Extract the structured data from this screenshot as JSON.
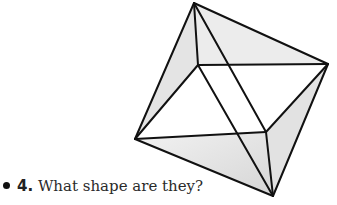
{
  "figure": {
    "name": "octahedron",
    "vertices": {
      "top": [
        194,
        3
      ],
      "right": [
        328,
        64
      ],
      "left": [
        135,
        139
      ],
      "bottom": [
        273,
        196
      ],
      "inner_back": [
        198,
        65
      ],
      "inner_front": [
        266,
        132
      ]
    }
  },
  "question": {
    "number": "4.",
    "text": " What shape are they?"
  }
}
